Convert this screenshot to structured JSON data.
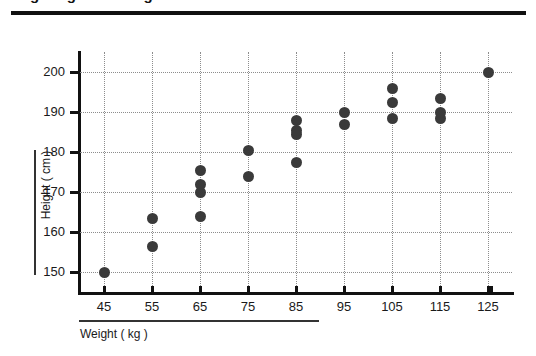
{
  "figure": {
    "cut_heading": "Height against Weight",
    "top_rule": "horizontal-rule"
  },
  "chart_data": {
    "type": "scatter",
    "title": "",
    "subtitle": "",
    "xlabel": "Weight ( kg )",
    "ylabel": "Height ( cm )",
    "xlim": [
      40,
      130
    ],
    "ylim": [
      145,
      205
    ],
    "xticks": [
      45,
      55,
      65,
      75,
      85,
      95,
      105,
      115,
      125
    ],
    "yticks": [
      150,
      160,
      170,
      180,
      190,
      200
    ],
    "grid": true,
    "legend": "none",
    "marker_color": "#3a3a3a",
    "points": [
      {
        "x": 45,
        "y": 150
      },
      {
        "x": 55,
        "y": 156.5
      },
      {
        "x": 55,
        "y": 163.5
      },
      {
        "x": 65,
        "y": 164
      },
      {
        "x": 65,
        "y": 170
      },
      {
        "x": 65,
        "y": 172
      },
      {
        "x": 65,
        "y": 175.5
      },
      {
        "x": 75,
        "y": 174
      },
      {
        "x": 75,
        "y": 180.5
      },
      {
        "x": 85,
        "y": 177.5
      },
      {
        "x": 85,
        "y": 184.5
      },
      {
        "x": 85,
        "y": 185.5
      },
      {
        "x": 85,
        "y": 188
      },
      {
        "x": 95,
        "y": 187
      },
      {
        "x": 95,
        "y": 190
      },
      {
        "x": 105,
        "y": 188.5
      },
      {
        "x": 105,
        "y": 192.5
      },
      {
        "x": 105,
        "y": 196
      },
      {
        "x": 115,
        "y": 188.5
      },
      {
        "x": 115,
        "y": 190
      },
      {
        "x": 115,
        "y": 193.5
      },
      {
        "x": 125,
        "y": 200
      }
    ]
  }
}
